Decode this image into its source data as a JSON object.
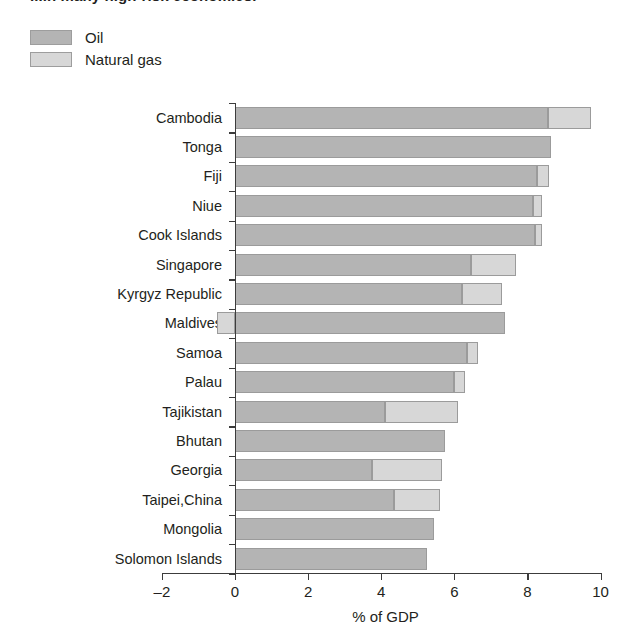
{
  "title": "...in many high-risk economies.",
  "legend": {
    "items": [
      {
        "label": "Oil",
        "color": "#b4b4b4",
        "key": "oil"
      },
      {
        "label": "Natural gas",
        "color": "#d7d7d7",
        "key": "gas"
      }
    ]
  },
  "axis": {
    "xlabel": "% of GDP",
    "xticks": [
      -2,
      0,
      2,
      4,
      6,
      8,
      10
    ],
    "xtick_labels": [
      "–2",
      "0",
      "2",
      "4",
      "6",
      "8",
      "10"
    ]
  },
  "chart_data": {
    "type": "bar",
    "orientation": "horizontal",
    "stacked": true,
    "title": "...in many high-risk economies.",
    "xlabel": "% of GDP",
    "ylabel": "",
    "xlim": [
      -2,
      10
    ],
    "grid": false,
    "legend_position": "top-left",
    "categories": [
      "Cambodia",
      "Tonga",
      "Fiji",
      "Niue",
      "Cook Islands",
      "Singapore",
      "Kyrgyz Republic",
      "Maldives",
      "Samoa",
      "Palau",
      "Tajikistan",
      "Bhutan",
      "Georgia",
      "Taipei,China",
      "Mongolia",
      "Solomon Islands"
    ],
    "series": [
      {
        "name": "Oil",
        "color": "#b4b4b4",
        "values": [
          8.55,
          8.65,
          8.25,
          8.15,
          8.2,
          6.45,
          6.2,
          7.4,
          6.35,
          6.0,
          4.1,
          5.75,
          3.75,
          4.35,
          5.45,
          5.25
        ]
      },
      {
        "name": "Natural gas",
        "color": "#d7d7d7",
        "values": [
          1.2,
          0.0,
          0.35,
          0.25,
          0.2,
          1.25,
          1.1,
          -0.5,
          0.3,
          0.3,
          2.0,
          0.0,
          1.9,
          1.25,
          0.0,
          0.0
        ]
      }
    ],
    "totals": [
      9.75,
      8.65,
      8.6,
      8.4,
      8.4,
      7.7,
      7.3,
      7.4,
      6.65,
      6.3,
      6.1,
      5.75,
      5.65,
      5.6,
      5.45,
      5.25
    ]
  }
}
